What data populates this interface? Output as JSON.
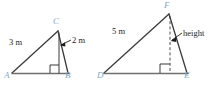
{
  "figure": {
    "colors": {
      "stroke": "#3b3b3b",
      "base_line": "#6b6b6b",
      "vertex_label": "#7fa8c9",
      "measure_text": "#1c1c1c",
      "background": "#ffffff"
    },
    "left_triangle": {
      "name": "triangle-ABC",
      "vertices": [
        {
          "id": "A",
          "label": "A",
          "x": 8,
          "y": 76
        },
        {
          "id": "B",
          "label": "B",
          "x": 68,
          "y": 76
        },
        {
          "id": "C",
          "label": "C",
          "x": 56,
          "y": 25
        }
      ],
      "right_angle_at": "B",
      "measures": [
        {
          "id": "side-AC",
          "label": "3 m"
        },
        {
          "id": "altitude-CB",
          "label": "2 m"
        }
      ]
    },
    "right_triangle": {
      "name": "triangle-DEF",
      "vertices": [
        {
          "id": "D",
          "label": "D",
          "x": 101,
          "y": 76
        },
        {
          "id": "E",
          "label": "E",
          "x": 186,
          "y": 76
        },
        {
          "id": "F",
          "label": "F",
          "x": 167,
          "y": 10
        }
      ],
      "right_angle_at": "foot-of-altitude",
      "measures": [
        {
          "id": "side-DF",
          "label": "5 m"
        },
        {
          "id": "altitude-F",
          "label": "height"
        }
      ]
    }
  }
}
